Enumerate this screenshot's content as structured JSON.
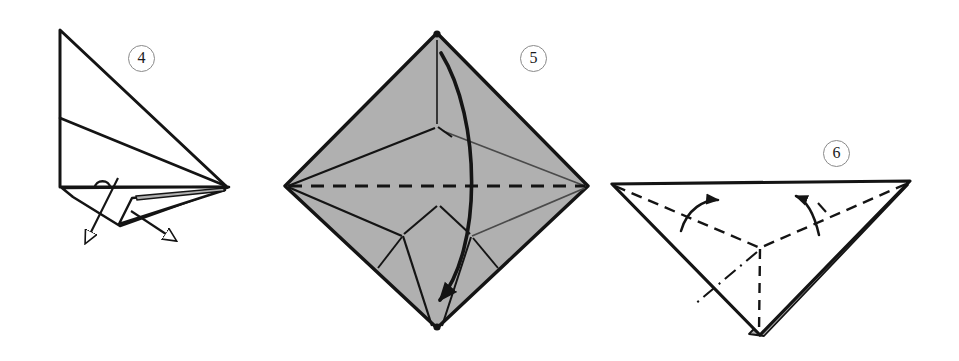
{
  "page": {
    "background_color": "#ffffff",
    "width": 959,
    "height": 361
  },
  "style": {
    "ink_color": "#141414",
    "paper_white": "#ffffff",
    "paper_gray": "#b0b0b0",
    "paper_gray_dark": "#9a9a9a",
    "badge_stroke": "#8a8a8a",
    "crease_light": "#4a4a4a"
  },
  "steps": [
    {
      "number": "4",
      "badge_label": "4",
      "name": "step-4-diagram",
      "description": "Side view of a folded triangular form with two arrows pointing down and outward",
      "arrows": [
        {
          "name": "pull-arrow-left",
          "direction": "down-left",
          "style": "straight-thin-open-head"
        },
        {
          "name": "pull-arrow-right",
          "direction": "down-right",
          "style": "straight-thin-open-head"
        }
      ],
      "fill": "white"
    },
    {
      "number": "5",
      "badge_label": "5",
      "name": "step-5-diagram",
      "description": "Gray shaded square rotated 45 degrees (diamond) with internal crease lines, a horizontal dashed valley fold across the middle, and a thick curved arrow from the top vertex to the bottom vertex",
      "shape": "diamond",
      "vertices": {
        "top": [
          437,
          33
        ],
        "right": [
          588,
          186
        ],
        "bottom": [
          437,
          328
        ],
        "left": [
          285,
          186
        ]
      },
      "fill": "gray",
      "dashed_fold": {
        "name": "horizontal-valley-fold",
        "from": [
          285,
          186
        ],
        "to": [
          588,
          186
        ]
      },
      "arrows": [
        {
          "name": "fold-over-arrow",
          "direction": "top-to-bottom",
          "style": "thick-curved-solid-head"
        }
      ],
      "corner_dots": [
        [
          437,
          33
        ],
        [
          437,
          328
        ]
      ]
    },
    {
      "number": "6",
      "badge_label": "6",
      "name": "step-6-diagram",
      "description": "Inverted triangle with dashed fold lines meeting at center and two curved arrows rotating upward; a narrow gray strip along the lower right edge",
      "shape": "inverted-triangle",
      "vertices": {
        "top_left": [
          612,
          184
        ],
        "top_right": [
          910,
          181
        ],
        "bottom": [
          760,
          335
        ]
      },
      "fill": "white-with-gray-edge-strip",
      "arrows": [
        {
          "name": "fold-up-arrow-left",
          "direction": "counterclockwise-up",
          "style": "curved-solid-head"
        },
        {
          "name": "fold-up-arrow-right",
          "direction": "counterclockwise-up",
          "style": "curved-solid-head"
        }
      ]
    }
  ]
}
